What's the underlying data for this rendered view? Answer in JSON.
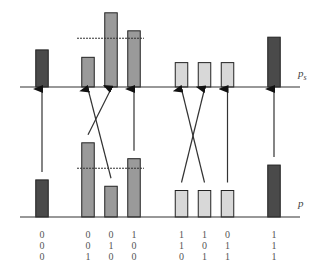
{
  "labels": {
    "top_axis": "p",
    "top_axis_sub": "s",
    "bottom_axis": "p"
  },
  "colors": {
    "dark": "#4a4a4a",
    "medium": "#9a9a9a",
    "light": "#d8d8d8",
    "stroke": "#222222",
    "axis": "#333333",
    "dashed": "#333333"
  },
  "states": [
    {
      "code": [
        "0",
        "0",
        "0"
      ],
      "group": "dark",
      "p": 0.35,
      "ps": 0.35,
      "target": 0
    },
    {
      "code": [
        "0",
        "0",
        "1"
      ],
      "group": "medium",
      "p": 0.7,
      "ps": 0.28,
      "target": 2
    },
    {
      "code": [
        "0",
        "1",
        "0"
      ],
      "group": "medium",
      "p": 0.29,
      "ps": 0.7,
      "target": 1
    },
    {
      "code": [
        "1",
        "0",
        "0"
      ],
      "group": "medium",
      "p": 0.55,
      "ps": 0.53,
      "target": 3
    },
    {
      "code": [
        "1",
        "1",
        "0"
      ],
      "group": "light",
      "p": 0.25,
      "ps": 0.23,
      "target": 5
    },
    {
      "code": [
        "1",
        "0",
        "1"
      ],
      "group": "light",
      "p": 0.25,
      "ps": 0.23,
      "target": 4
    },
    {
      "code": [
        "0",
        "1",
        "1"
      ],
      "group": "light",
      "p": 0.25,
      "ps": 0.23,
      "target": 6
    },
    {
      "code": [
        "1",
        "1",
        "1"
      ],
      "group": "dark",
      "p": 0.49,
      "ps": 0.47,
      "target": 7
    }
  ],
  "threshold": {
    "level": 0.46,
    "span": [
      1,
      3
    ]
  }
}
